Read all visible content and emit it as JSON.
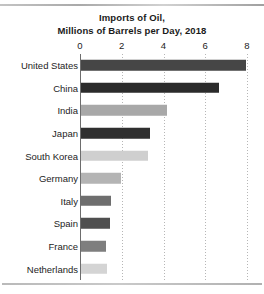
{
  "chart_data": {
    "type": "bar",
    "orientation": "horizontal",
    "title": "Imports of Oil, Millions of Barrels per Day, 2018",
    "title_line1": "Imports of Oil,",
    "title_line2": "Millions of Barrels per Day, 2018",
    "xlabel": "",
    "ylabel": "",
    "xlim": [
      0,
      8
    ],
    "xticks": [
      "0",
      "2",
      "4",
      "6",
      "8"
    ],
    "xtick_values": [
      0,
      2,
      4,
      6,
      8
    ],
    "grid": "vertical-dotted",
    "legend": "none",
    "categories": [
      "United States",
      "China",
      "India",
      "Japan",
      "South Korea",
      "Germany",
      "Italy",
      "Spain",
      "France",
      "Netherlands"
    ],
    "values": [
      7.9,
      6.6,
      4.1,
      3.3,
      3.2,
      1.9,
      1.45,
      1.4,
      1.2,
      1.25
    ],
    "bar_colors": [
      "#464646",
      "#2b2b2b",
      "#a8a8a8",
      "#2f2f2f",
      "#cfcfcf",
      "#b4b4b4",
      "#6e6e6e",
      "#4f4f4f",
      "#7e7e7e",
      "#d4d4d4"
    ]
  },
  "axis": {
    "baseline_color": "#6d6d6d",
    "gridline_color": "#9e9e9e"
  }
}
